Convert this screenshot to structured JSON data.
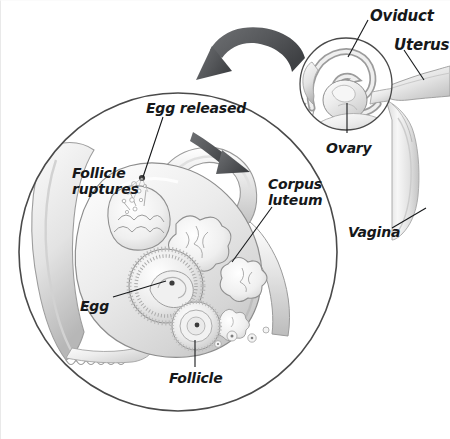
{
  "figure": {
    "background_color": "#ffffff",
    "ink_color": "#16181a",
    "outline_color": "#4a4a4a",
    "tissue_light": "#f4f4f4",
    "tissue_mid": "#d8d8d8",
    "tissue_dark": "#a9a9a9",
    "arrow_color": "#555759"
  },
  "inset": {
    "name": "overview-inset",
    "circle": {
      "cx": 346,
      "cy": 84,
      "r": 47
    },
    "labels": [
      {
        "id": "oviduct",
        "text": "Oviduct",
        "x": 370,
        "y": 8,
        "align": "left"
      },
      {
        "id": "uterus",
        "text": "Uterus",
        "x": 398,
        "y": 36,
        "align": "left"
      },
      {
        "id": "ovary",
        "text": "Ovary",
        "x": 328,
        "y": 142,
        "align": "left"
      },
      {
        "id": "vagina",
        "text": "Vagina",
        "x": 350,
        "y": 226,
        "align": "left"
      }
    ]
  },
  "magnifier": {
    "name": "magnified-ovary",
    "circle": {
      "cx": 178,
      "cy": 252,
      "r": 160
    },
    "labels": [
      {
        "id": "egg-released",
        "text": "Egg released",
        "x": 148,
        "y": 103,
        "align": "left"
      },
      {
        "id": "follicle-ruptures",
        "text": "Follicle\nruptures",
        "x": 75,
        "y": 167,
        "align": "left"
      },
      {
        "id": "corpus-luteum",
        "text": "Corpus\nluteum",
        "x": 270,
        "y": 178,
        "align": "left"
      },
      {
        "id": "egg",
        "text": "Egg",
        "x": 82,
        "y": 301,
        "align": "left"
      },
      {
        "id": "follicle",
        "text": "Follicle",
        "x": 171,
        "y": 373,
        "align": "left"
      }
    ]
  },
  "arrows": [
    {
      "id": "zoom-arrow",
      "description": "large curved arrow from inset to magnified view",
      "head_x": 210,
      "head_y": 80
    },
    {
      "id": "egg-path-arrow",
      "description": "curved arrow showing egg travel into oviduct",
      "head_x": 248,
      "head_y": 168
    }
  ],
  "leaders": [
    {
      "id": "leader-oviduct",
      "from_x": 368,
      "from_y": 20,
      "to_x": 348,
      "to_y": 57
    },
    {
      "id": "leader-uterus",
      "from_x": 404,
      "from_y": 50,
      "to_x": 424,
      "to_y": 80
    },
    {
      "id": "leader-ovary",
      "from_x": 347,
      "from_y": 133,
      "to_x": 347,
      "to_y": 103
    },
    {
      "id": "leader-vagina",
      "from_x": 392,
      "from_y": 228,
      "to_x": 424,
      "to_y": 209
    },
    {
      "id": "leader-egg-released",
      "from_x": 163,
      "from_y": 117,
      "to_x": 143,
      "to_y": 177
    },
    {
      "id": "leader-corpus-luteum",
      "from_x": 271,
      "from_y": 207,
      "to_x": 232,
      "to_y": 262
    },
    {
      "id": "leader-egg",
      "from_x": 113,
      "from_y": 297,
      "to_x": 162,
      "to_y": 282
    },
    {
      "id": "leader-follicle",
      "from_x": 195,
      "from_y": 367,
      "to_x": 195,
      "to_y": 340
    }
  ]
}
